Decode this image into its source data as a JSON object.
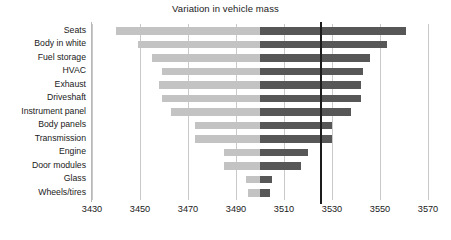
{
  "chart_data": {
    "type": "bar",
    "subtype": "tornado",
    "title": "Variation in vehicle mass",
    "xlabel": "",
    "ylabel": "",
    "xlim": [
      3430,
      3570
    ],
    "xticks": [
      3430,
      3450,
      3470,
      3490,
      3510,
      3530,
      3550,
      3570
    ],
    "xticklabels": [
      "3430",
      "3450",
      "3470",
      "3490",
      "3510",
      "3530",
      "3550",
      "3570"
    ],
    "grid": true,
    "grid_axis": "x",
    "legend": "none",
    "baseline_value": 3500,
    "reference_line_value": 3525,
    "colors": {
      "low_segment": "#c3c3c3",
      "high_segment": "#575757",
      "reference_line": "#1c1c1c",
      "gridline": "#c9c9c9",
      "background": "#ffffff"
    },
    "categories": [
      "Seats",
      "Body in white",
      "Fuel storage",
      "HVAC",
      "Exhaust",
      "Driveshaft",
      "Instrument panel",
      "Body panels",
      "Transmission",
      "Engine",
      "Door modules",
      "Glass",
      "Wheels/tires"
    ],
    "low_values": [
      3440,
      3449,
      3455,
      3459,
      3458,
      3459,
      3463,
      3473,
      3473,
      3485,
      3485,
      3494,
      3495
    ],
    "high_values": [
      3561,
      3553,
      3546,
      3543,
      3542,
      3542,
      3538,
      3530,
      3530,
      3520,
      3517,
      3505,
      3504
    ],
    "bars": [
      {
        "category": "Seats",
        "low": 3440,
        "high": 3561,
        "range": 121
      },
      {
        "category": "Body in white",
        "low": 3449,
        "high": 3553,
        "range": 104
      },
      {
        "category": "Fuel storage",
        "low": 3455,
        "high": 3546,
        "range": 91
      },
      {
        "category": "HVAC",
        "low": 3459,
        "high": 3543,
        "range": 84
      },
      {
        "category": "Exhaust",
        "low": 3458,
        "high": 3542,
        "range": 84
      },
      {
        "category": "Driveshaft",
        "low": 3459,
        "high": 3542,
        "range": 83
      },
      {
        "category": "Instrument panel",
        "low": 3463,
        "high": 3538,
        "range": 75
      },
      {
        "category": "Body panels",
        "low": 3473,
        "high": 3530,
        "range": 57
      },
      {
        "category": "Transmission",
        "low": 3473,
        "high": 3530,
        "range": 57
      },
      {
        "category": "Engine",
        "low": 3485,
        "high": 3520,
        "range": 35
      },
      {
        "category": "Door modules",
        "low": 3485,
        "high": 3517,
        "range": 32
      },
      {
        "category": "Glass",
        "low": 3494,
        "high": 3505,
        "range": 11
      },
      {
        "category": "Wheels/tires",
        "low": 3495,
        "high": 3504,
        "range": 9
      }
    ]
  }
}
